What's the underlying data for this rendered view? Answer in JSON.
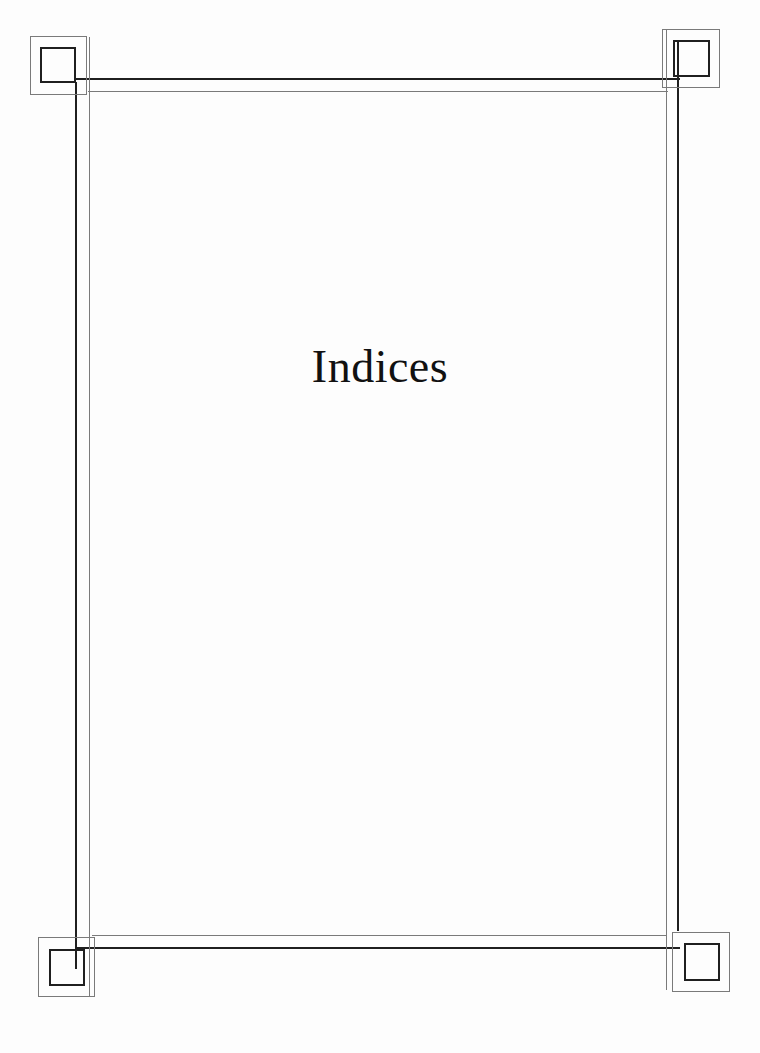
{
  "page": {
    "title": "Indices"
  },
  "frame": {
    "style": "double-line border with square corner ornaments",
    "colors": {
      "dark_line": "#1f1f1f",
      "light_line": "#7a7a7a",
      "background": "#fdfdfd"
    }
  }
}
